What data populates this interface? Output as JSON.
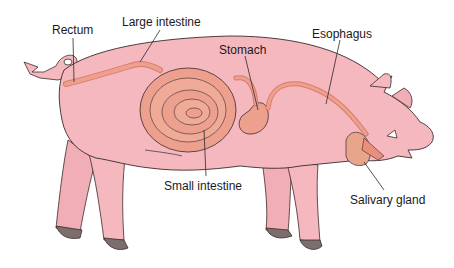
{
  "diagram": {
    "labels": {
      "rectum": "Rectum",
      "large_intestine": "Large intestine",
      "stomach": "Stomach",
      "esophagus": "Esophagus",
      "small_intestine": "Small intestine",
      "salivary_gland": "Salivary gland"
    },
    "colors": {
      "body": "#f5b8bf",
      "body_shade": "#ec9ea8",
      "outline": "#3a2a2a",
      "organ": "#eea08f",
      "organ_dark": "#d97a6a",
      "hoof": "#7a6f6c",
      "gland": "#e9a48c"
    }
  }
}
